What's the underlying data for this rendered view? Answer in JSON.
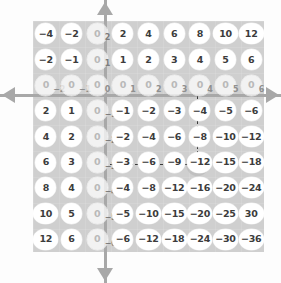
{
  "figure": {
    "panel_color": "#cfcfcf",
    "bubble_color": "#ffffff",
    "axis_color": "#a8a8a8",
    "highlight_color": "#3a3a3a"
  },
  "axes": {
    "up_arrow": "arrow-up",
    "down_arrow": "arrow-down",
    "left_arrow": "arrow-left",
    "right_arrow": "arrow-right"
  },
  "chart_data": {
    "type": "table",
    "title": "",
    "xlabel": "",
    "ylabel": "",
    "columns": [
      -2,
      -1,
      0,
      1,
      2,
      3,
      4,
      5,
      6
    ],
    "rows": [
      2,
      1,
      0,
      -1,
      -2,
      -3,
      -4,
      -5,
      -6
    ],
    "grid": true,
    "legend": "none",
    "highlight": {
      "row": -3,
      "column": 4,
      "value": -12
    },
    "values": [
      [
        -4,
        -2,
        0,
        2,
        4,
        6,
        8,
        10,
        12
      ],
      [
        -2,
        -1,
        0,
        1,
        2,
        3,
        4,
        5,
        6
      ],
      [
        0,
        0,
        0,
        0,
        0,
        0,
        0,
        0,
        0
      ],
      [
        2,
        1,
        0,
        -1,
        -2,
        -3,
        -4,
        -5,
        -6
      ],
      [
        4,
        2,
        0,
        -2,
        -4,
        -6,
        -8,
        -10,
        -12
      ],
      [
        6,
        3,
        0,
        -3,
        -6,
        -9,
        -12,
        -15,
        -18
      ],
      [
        8,
        4,
        0,
        -4,
        -8,
        -12,
        -16,
        -20,
        -24
      ],
      [
        10,
        5,
        0,
        -5,
        -10,
        -15,
        -20,
        -25,
        -30
      ],
      [
        12,
        6,
        0,
        -6,
        -12,
        -18,
        -24,
        -30,
        -36
      ]
    ]
  },
  "cells": [
    [
      {
        "t": "−4"
      },
      {
        "t": "−2"
      },
      {
        "t": "0",
        "sub": "2",
        "zero": true
      },
      {
        "t": "2"
      },
      {
        "t": "4"
      },
      {
        "t": "6"
      },
      {
        "t": "8"
      },
      {
        "t": "10",
        "wide": true
      },
      {
        "t": "12",
        "wide": true
      }
    ],
    [
      {
        "t": "−2"
      },
      {
        "t": "−1"
      },
      {
        "t": "0",
        "sub": "1",
        "zero": true
      },
      {
        "t": "1"
      },
      {
        "t": "2"
      },
      {
        "t": "3"
      },
      {
        "t": "4"
      },
      {
        "t": "5"
      },
      {
        "t": "6"
      }
    ],
    [
      {
        "t": "0",
        "sub": "−2",
        "zero": true,
        "axisrow": true
      },
      {
        "t": "0",
        "sub": "−1",
        "zero": true,
        "axisrow": true
      },
      {
        "t": "0",
        "sub": "0",
        "zero": true,
        "axisrow": true
      },
      {
        "t": "0",
        "sub": "1",
        "zero": true,
        "axisrow": true
      },
      {
        "t": "0",
        "sub": "2",
        "zero": true,
        "axisrow": true
      },
      {
        "t": "0",
        "sub": "3",
        "zero": true,
        "axisrow": true
      },
      {
        "t": "0",
        "sub": "4",
        "zero": true,
        "axisrow": true
      },
      {
        "t": "0",
        "sub": "5",
        "zero": true,
        "axisrow": true
      },
      {
        "t": "0",
        "sub": "6",
        "zero": true,
        "axisrow": true
      }
    ],
    [
      {
        "t": "2"
      },
      {
        "t": "1"
      },
      {
        "t": "0",
        "sub": "−1",
        "zero": true
      },
      {
        "t": "−1"
      },
      {
        "t": "−2"
      },
      {
        "t": "−3"
      },
      {
        "t": "−4"
      },
      {
        "t": "−5"
      },
      {
        "t": "−6"
      }
    ],
    [
      {
        "t": "4"
      },
      {
        "t": "2"
      },
      {
        "t": "0",
        "sub": "−2",
        "zero": true
      },
      {
        "t": "−2"
      },
      {
        "t": "−4"
      },
      {
        "t": "−6"
      },
      {
        "t": "−8"
      },
      {
        "t": "−10",
        "wide": true
      },
      {
        "t": "−12",
        "wide": true
      }
    ],
    [
      {
        "t": "6"
      },
      {
        "t": "3"
      },
      {
        "t": "0",
        "sub": "−3",
        "zero": true
      },
      {
        "t": "−3"
      },
      {
        "t": "−6"
      },
      {
        "t": "−9"
      },
      {
        "t": "−12",
        "wide": true
      },
      {
        "t": "−15",
        "wide": true
      },
      {
        "t": "−18",
        "wide": true
      }
    ],
    [
      {
        "t": "8"
      },
      {
        "t": "4"
      },
      {
        "t": "0",
        "sub": "−4",
        "zero": true
      },
      {
        "t": "−4"
      },
      {
        "t": "−8"
      },
      {
        "t": "−12",
        "wide": true
      },
      {
        "t": "−16",
        "wide": true
      },
      {
        "t": "−20",
        "wide": true
      },
      {
        "t": "−24",
        "wide": true
      }
    ],
    [
      {
        "t": "10",
        "wide": true
      },
      {
        "t": "5"
      },
      {
        "t": "0",
        "sub": "−5",
        "zero": true
      },
      {
        "t": "−5"
      },
      {
        "t": "−10",
        "wide": true
      },
      {
        "t": "−15",
        "wide": true
      },
      {
        "t": "−20",
        "wide": true
      },
      {
        "t": "−25",
        "wide": true
      },
      {
        "t": "30",
        "wide": true
      }
    ],
    [
      {
        "t": "12",
        "wide": true
      },
      {
        "t": "6"
      },
      {
        "t": "0",
        "sub": "−6",
        "zero": true
      },
      {
        "t": "−6"
      },
      {
        "t": "−12",
        "wide": true
      },
      {
        "t": "−18",
        "wide": true
      },
      {
        "t": "−24",
        "wide": true
      },
      {
        "t": "−30",
        "wide": true
      },
      {
        "t": "−36",
        "wide": true
      }
    ]
  ]
}
